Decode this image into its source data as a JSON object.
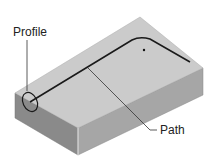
{
  "diagram": {
    "type": "isometric-sweep-illustration",
    "labels": {
      "profile": "Profile",
      "path": "Path"
    },
    "colors": {
      "top_face": "#c9c9c9",
      "front_face": "#8e8e8e",
      "right_face": "#a8a8a8",
      "path_line": "#1a1a1a",
      "leader_line": "#333333"
    }
  }
}
